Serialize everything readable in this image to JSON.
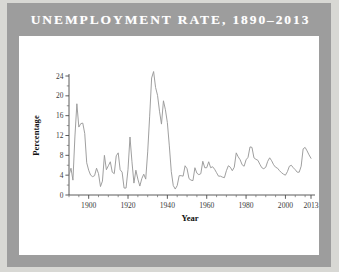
{
  "card": {
    "title": "UNEMPLOYMENT RATE, 1890–2013",
    "frame_color": "#9d9d9d",
    "panel_color": "#ffffff",
    "page_background": "#d8d8d4",
    "title_color": "#ffffff"
  },
  "chart_data": {
    "type": "line",
    "title": "UNEMPLOYMENT RATE, 1890–2013",
    "xlabel": "Year",
    "ylabel": "Percentage",
    "xlim": [
      1890,
      2013
    ],
    "ylim": [
      0,
      24
    ],
    "grid": false,
    "legend": null,
    "line_color": "#9a9a9a",
    "x_ticks_major": [
      1900,
      1920,
      1940,
      1960,
      1980,
      2000,
      2013
    ],
    "x_tick_labels": [
      "1900",
      "1920",
      "1940",
      "1960",
      "1980",
      "2000",
      "2013"
    ],
    "x_ticks_minor_step": 5,
    "y_ticks_major": [
      0,
      4,
      8,
      12,
      16,
      20,
      24
    ],
    "y_tick_labels": [
      "0",
      "4",
      "8",
      "12",
      "16",
      "20",
      "24"
    ],
    "y_ticks_minor_step": 2,
    "series": [
      {
        "name": "Unemployment rate",
        "x": [
          1890,
          1891,
          1892,
          1893,
          1894,
          1895,
          1896,
          1897,
          1898,
          1899,
          1900,
          1901,
          1902,
          1903,
          1904,
          1905,
          1906,
          1907,
          1908,
          1909,
          1910,
          1911,
          1912,
          1913,
          1914,
          1915,
          1916,
          1917,
          1918,
          1919,
          1920,
          1921,
          1922,
          1923,
          1924,
          1925,
          1926,
          1927,
          1928,
          1929,
          1930,
          1931,
          1932,
          1933,
          1934,
          1935,
          1936,
          1937,
          1938,
          1939,
          1940,
          1941,
          1942,
          1943,
          1944,
          1945,
          1946,
          1947,
          1948,
          1949,
          1950,
          1951,
          1952,
          1953,
          1954,
          1955,
          1956,
          1957,
          1958,
          1959,
          1960,
          1961,
          1962,
          1963,
          1964,
          1965,
          1966,
          1967,
          1968,
          1969,
          1970,
          1971,
          1972,
          1973,
          1974,
          1975,
          1976,
          1977,
          1978,
          1979,
          1980,
          1981,
          1982,
          1983,
          1984,
          1985,
          1986,
          1987,
          1988,
          1989,
          1990,
          1991,
          1992,
          1993,
          1994,
          1995,
          1996,
          1997,
          1998,
          1999,
          2000,
          2001,
          2002,
          2003,
          2004,
          2005,
          2006,
          2007,
          2008,
          2009,
          2010,
          2011,
          2012,
          2013
        ],
        "values": [
          4.0,
          5.4,
          3.0,
          11.7,
          18.4,
          13.7,
          14.4,
          14.5,
          12.4,
          6.5,
          5.0,
          4.0,
          3.7,
          3.9,
          5.4,
          4.3,
          1.7,
          2.8,
          8.0,
          5.1,
          5.9,
          6.7,
          4.6,
          4.3,
          7.9,
          8.5,
          5.1,
          4.6,
          1.4,
          1.4,
          5.2,
          11.7,
          6.7,
          2.4,
          5.0,
          3.2,
          1.8,
          3.3,
          4.2,
          3.2,
          8.7,
          15.9,
          23.6,
          24.9,
          21.7,
          20.1,
          16.9,
          14.3,
          19.0,
          17.2,
          14.6,
          9.9,
          4.7,
          1.9,
          1.2,
          1.9,
          3.9,
          3.9,
          3.8,
          5.9,
          5.3,
          3.3,
          3.0,
          2.9,
          5.5,
          4.4,
          4.1,
          4.3,
          6.8,
          5.5,
          5.5,
          6.7,
          5.5,
          5.7,
          5.2,
          4.5,
          3.8,
          3.8,
          3.6,
          3.5,
          4.9,
          5.9,
          5.6,
          4.9,
          5.6,
          8.5,
          7.7,
          7.1,
          6.1,
          5.8,
          7.1,
          7.6,
          9.7,
          9.6,
          7.5,
          7.2,
          7.0,
          6.2,
          5.5,
          5.3,
          5.6,
          6.8,
          7.5,
          6.9,
          6.1,
          5.6,
          5.4,
          4.9,
          4.5,
          4.2,
          4.0,
          4.7,
          5.8,
          6.0,
          5.5,
          5.1,
          4.6,
          4.6,
          5.8,
          9.3,
          9.6,
          8.9,
          8.1,
          7.4
        ]
      }
    ]
  }
}
